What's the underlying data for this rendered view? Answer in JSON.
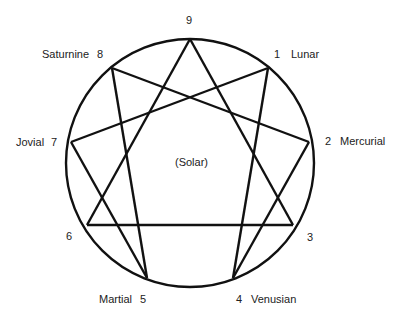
{
  "diagram": {
    "type": "enneagram",
    "circle": {
      "cx": 190,
      "cy": 163,
      "r": 124
    },
    "center_label": "(Solar)",
    "points": [
      {
        "n": "9",
        "name": "",
        "x": 190,
        "y": 39
      },
      {
        "n": "1",
        "name": "Lunar",
        "x": 268,
        "y": 68
      },
      {
        "n": "2",
        "name": "Mercurial",
        "x": 309,
        "y": 142
      },
      {
        "n": "3",
        "name": "",
        "x": 293,
        "y": 225
      },
      {
        "n": "4",
        "name": "Venusian",
        "x": 233,
        "y": 278
      },
      {
        "n": "5",
        "name": "Martial",
        "x": 147,
        "y": 278
      },
      {
        "n": "6",
        "name": "",
        "x": 87,
        "y": 225
      },
      {
        "n": "7",
        "name": "Jovial",
        "x": 71,
        "y": 142
      },
      {
        "n": "8",
        "name": "Saturnine",
        "x": 112,
        "y": 68
      }
    ],
    "labels": {
      "p9": "9",
      "p1_num": "1",
      "p1_name": "Lunar",
      "p2_num": "2",
      "p2_name": "Mercurial",
      "p3": "3",
      "p4_num": "4",
      "p4_name": "Venusian",
      "p5_name": "Martial",
      "p5_num": "5",
      "p6": "6",
      "p7_name": "Jovial",
      "p7_num": "7",
      "p8_name": "Saturnine",
      "p8_num": "8"
    },
    "triangle": [
      "9",
      "3",
      "6"
    ],
    "hexad": [
      "1",
      "4",
      "2",
      "8",
      "5",
      "7"
    ],
    "stroke_color": "#111111"
  }
}
